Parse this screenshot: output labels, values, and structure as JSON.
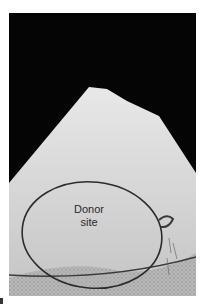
{
  "figure": {
    "label_line1": "Donor",
    "label_line2": "site",
    "outline_color": "#2b2b2b",
    "background_color": "#050505",
    "skin_color": "#d9d9d9"
  }
}
